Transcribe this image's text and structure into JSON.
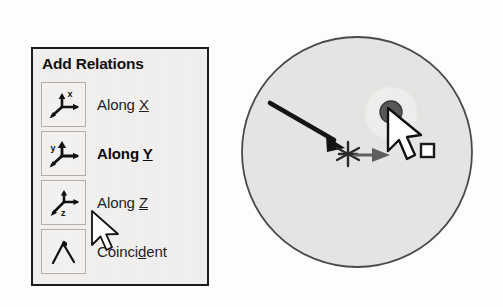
{
  "menu": {
    "title": "Add Relations",
    "items": [
      {
        "id": "along-x",
        "label_prefix": "Along ",
        "accel": "X",
        "icon": "axis-along-x-icon",
        "selected": false
      },
      {
        "id": "along-y",
        "label_prefix": "Along ",
        "accel": "Y",
        "icon": "axis-along-y-icon",
        "selected": true
      },
      {
        "id": "along-z",
        "label_prefix": "Along ",
        "accel": "Z",
        "icon": "axis-along-z-icon",
        "selected": false
      },
      {
        "id": "coincident",
        "label_prefix": "Coinci",
        "accel": "d",
        "label_suffix": "ent",
        "icon": "coincident-angle-icon",
        "selected": false
      }
    ],
    "cursor_icon": "mouse-pointer-icon",
    "colors": {
      "panel_background": "#f2f1ef",
      "panel_border": "#1c1c1c",
      "icon_box_border": "#b4b0aa",
      "text": "#1f1f1f"
    }
  },
  "sketch": {
    "circle_icon": "filled-circle-shape",
    "arrow_icon": "black-direction-arrow-icon",
    "point_icon": "sketch-point-star-icon",
    "axis_arrow_icon": "gray-axis-arrow-icon",
    "handle_icon": "dark-gray-point-handle-icon",
    "cursor_icon": "mouse-pointer-icon",
    "square_icon": "small-white-square-marker-icon",
    "colors": {
      "circle_fill": "#e4e4e2",
      "circle_stroke": "#4a4a4a",
      "arrow": "#141414",
      "axis_arrow": "#5e5e5e",
      "handle": "#585858",
      "square_fill": "#ffffff",
      "square_stroke": "#1a1a1a"
    }
  }
}
